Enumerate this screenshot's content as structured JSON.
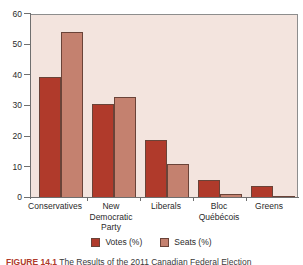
{
  "chart_data": {
    "type": "bar",
    "title": "",
    "subtitle": "",
    "xlabel": "",
    "ylabel": "",
    "ylim": [
      0,
      60
    ],
    "yticks": [
      0,
      10,
      20,
      30,
      40,
      50,
      60
    ],
    "ytick_labels": [
      "0",
      "10",
      "20",
      "30",
      "40",
      "50",
      "60"
    ],
    "grid": false,
    "legend_position": "bottom",
    "categories": [
      "Conservatives",
      "New Democratic Party",
      "Liberals",
      "Bloc Québécois",
      "Greens"
    ],
    "category_lines": [
      [
        "Conservatives"
      ],
      [
        "New",
        "Democratic",
        "Party"
      ],
      [
        "Liberals"
      ],
      [
        "Bloc",
        "Québécois"
      ],
      [
        "Greens"
      ]
    ],
    "series": [
      {
        "name": "Votes (%)",
        "color": "#B03A2B",
        "values": [
          39.6,
          30.6,
          18.9,
          6.0,
          3.9
        ]
      },
      {
        "name": "Seats (%)",
        "color": "#C4816F",
        "values": [
          54.2,
          33.1,
          11.0,
          1.3,
          0.3
        ]
      }
    ]
  },
  "legend": {
    "items": [
      {
        "label": "Votes (%)",
        "color": "#B03A2B"
      },
      {
        "label": "Seats (%)",
        "color": "#C4816F"
      }
    ]
  },
  "caption": {
    "figure_number": "FIGURE 14.1",
    "text": "The Results of the 2011 Canadian Federal Election"
  },
  "colors": {
    "votes": "#B03A2B",
    "seats": "#C4816F",
    "plot_background": "#F3E4DE",
    "axis": "#6f6f6f",
    "text": "#2a2a2a"
  }
}
